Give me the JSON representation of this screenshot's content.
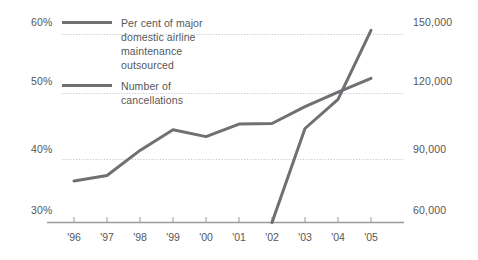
{
  "chart_data": {
    "type": "line",
    "title": "",
    "subtitle": "",
    "xlabel": "",
    "ylabel": "",
    "grid": true,
    "legend_position": "inside-top-left",
    "x": [
      "'96",
      "'97",
      "'98",
      "'99",
      "'00",
      "'01",
      "'02",
      "'03",
      "'04",
      "'05"
    ],
    "left_axis": {
      "label": "Per cent of major domestic airline maintenance outsourced",
      "ticks": [
        "30%",
        "40%",
        "50%",
        "60%"
      ],
      "tick_values": [
        30,
        40,
        50,
        60
      ],
      "ylim": [
        30,
        61
      ]
    },
    "right_axis": {
      "label": "Number of cancellations",
      "ticks": [
        "60,000",
        "90,000",
        "120,000",
        "150,000"
      ],
      "tick_values": [
        60000,
        90000,
        120000,
        150000
      ],
      "ylim": [
        60000,
        155000
      ]
    },
    "series": [
      {
        "name": "Per cent of major domestic airline maintenance outsourced",
        "axis": "left",
        "color": "#6e7073",
        "units": "percent",
        "values": [
          36.6,
          37.5,
          41.5,
          44.8,
          43.7,
          45.7,
          45.8,
          48.5,
          50.8,
          53.0
        ]
      },
      {
        "name": "Number of cancellations",
        "axis": "right",
        "color": "#6e7073",
        "units": "count",
        "x_start": "'02",
        "values": [
          null,
          null,
          null,
          null,
          null,
          null,
          60000,
          105000,
          119000,
          152000
        ]
      }
    ],
    "legend": [
      {
        "label": "Per cent of major\ndomestic airline\nmaintenance\noutsourced",
        "color": "#6e7073"
      },
      {
        "label": "Number of\ncancellations",
        "color": "#6e7073"
      }
    ],
    "colors": {
      "line": "#6e7073",
      "grid": "#c9c9c9",
      "axis": "#9a9a9a",
      "text": "#55575a",
      "background": "#ffffff"
    }
  }
}
